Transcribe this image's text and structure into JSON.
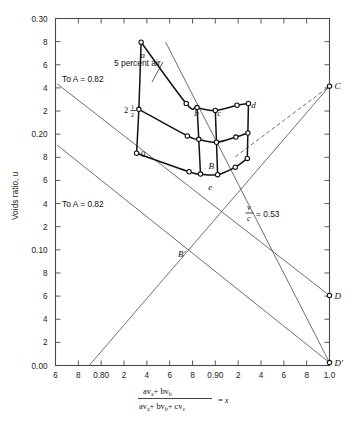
{
  "figure": {
    "title": "",
    "y_axis_title": "Voids ratio, u",
    "x_axis_formula": {
      "numerator": "av",
      "numerator_sub_a": "a",
      "numerator_plus": "+ bv",
      "numerator_sub_b": "b",
      "denominator": "av",
      "denominator_sub_a": "a",
      "denominator_mid": "+ bv",
      "denominator_sub_b": "b",
      "denominator_end": "+ cv",
      "denominator_sub_c": "c",
      "equals": "= x",
      "plain": "(av_a + bv_b) / (av_a + bv_b + cv_c) = x"
    }
  },
  "chart_data": {
    "type": "line",
    "xlabel": "(av_a + bv_b) / (av_a + bv_b + cv_c) = x",
    "ylabel": "Voids ratio, u",
    "xlim": [
      0.76,
      1.0
    ],
    "ylim": [
      0.0,
      0.3
    ],
    "grid": false,
    "legend_position": "none",
    "x_ticks": [
      {
        "value": 0.76,
        "label": "6"
      },
      {
        "value": 0.78,
        "label": "8"
      },
      {
        "value": 0.8,
        "label": "0.80"
      },
      {
        "value": 0.82,
        "label": "2"
      },
      {
        "value": 0.84,
        "label": "4"
      },
      {
        "value": 0.86,
        "label": "6"
      },
      {
        "value": 0.88,
        "label": "8"
      },
      {
        "value": 0.9,
        "label": "0.90"
      },
      {
        "value": 0.92,
        "label": "2"
      },
      {
        "value": 0.94,
        "label": "4"
      },
      {
        "value": 0.96,
        "label": "6"
      },
      {
        "value": 0.98,
        "label": "8"
      },
      {
        "value": 1.0,
        "label": "1.0"
      }
    ],
    "y_ticks": [
      {
        "value": 0.3,
        "label": "0.30"
      },
      {
        "value": 0.28,
        "label": "8"
      },
      {
        "value": 0.26,
        "label": "6"
      },
      {
        "value": 0.24,
        "label": "4"
      },
      {
        "value": 0.22,
        "label": "2"
      },
      {
        "value": 0.2,
        "label": "0.20"
      },
      {
        "value": 0.18,
        "label": "8"
      },
      {
        "value": 0.16,
        "label": "6"
      },
      {
        "value": 0.14,
        "label": "4"
      },
      {
        "value": 0.12,
        "label": "2"
      },
      {
        "value": 0.1,
        "label": "0.10"
      },
      {
        "value": 0.08,
        "label": "8"
      },
      {
        "value": 0.06,
        "label": "6"
      },
      {
        "value": 0.04,
        "label": "4"
      },
      {
        "value": 0.02,
        "label": "2"
      },
      {
        "value": 0.0,
        "label": "0.00"
      }
    ],
    "annotations": [
      {
        "name": "five-percent-air",
        "text": "5 percent air",
        "x": 0.845,
        "y": 0.272
      },
      {
        "name": "contour-2half",
        "text": "2",
        "fraction": "1/2",
        "x": 0.828,
        "y": 0.222
      },
      {
        "name": "contour-0",
        "text": "0",
        "x": 0.835,
        "y": 0.182
      },
      {
        "name": "to-a-upper",
        "text": "To A = 0.82",
        "x": 0.782,
        "y": 0.241
      },
      {
        "name": "to-a-lower",
        "text": "To A = 0.82",
        "x": 0.782,
        "y": 0.143
      },
      {
        "name": "v-over-c",
        "text": "v/c = 0.53",
        "x": 0.935,
        "y": 0.124
      }
    ],
    "point_labels": [
      {
        "name": "a",
        "text": "a",
        "x": 0.8365,
        "y": 0.2685
      },
      {
        "name": "b",
        "text": "b",
        "x": 0.8835,
        "y": 0.2185
      },
      {
        "name": "c",
        "text": "c",
        "x": 0.9035,
        "y": 0.2185
      },
      {
        "name": "d",
        "text": "d",
        "x": 0.9335,
        "y": 0.2255
      },
      {
        "name": "B",
        "text": "B",
        "x": 0.8965,
        "y": 0.1725
      },
      {
        "name": "e",
        "text": "e",
        "x": 0.8955,
        "y": 0.1545
      },
      {
        "name": "B-prime",
        "text": "B'",
        "x": 0.8705,
        "y": 0.0965
      },
      {
        "name": "C",
        "text": "C",
        "x": 1.004,
        "y": 0.2415
      },
      {
        "name": "D",
        "text": "D",
        "x": 1.004,
        "y": 0.0605
      },
      {
        "name": "D-prime",
        "text": "D'",
        "x": 1.004,
        "y": 0.0025
      }
    ],
    "rays": [
      {
        "name": "ray-A-upper",
        "from": [
          0.7615,
          0.2435
        ],
        "to": [
          1.0,
          0.0605
        ],
        "style": "solid",
        "note": "To A=0.82 upper line to D"
      },
      {
        "name": "ray-A-lower",
        "from": [
          0.7615,
          0.1905
        ],
        "to": [
          1.0,
          0.0025
        ],
        "style": "solid",
        "note": "To A=0.82 lower line to D'"
      },
      {
        "name": "ray-to-C",
        "from": [
          0.7895,
          0.0
        ],
        "to": [
          1.0,
          0.2415
        ],
        "style": "solid",
        "note": "rising line to C"
      },
      {
        "name": "ray-e-to-Dprime",
        "from": [
          0.8565,
          0.2795
        ],
        "to": [
          1.0,
          0.0025
        ],
        "style": "solid",
        "note": "5 percent air line through e to D'"
      },
      {
        "name": "ray-C-dashed",
        "from": [
          0.9175,
          0.1805
        ],
        "to": [
          1.0,
          0.2415
        ],
        "style": "dashed",
        "note": "dashed segment to C"
      }
    ],
    "mesh": {
      "note": "Curvilinear quadrilateral mesh of test points (open circles) bounded by heavy curves",
      "rows": [
        {
          "name": "row-5-percent-air",
          "label": "5 percent air",
          "points": [
            [
              0.835,
              0.2795
            ],
            [
              0.8745,
              0.2265
            ],
            [
              0.884,
              0.223
            ],
            [
              0.9,
              0.2205
            ],
            [
              0.919,
              0.225
            ],
            [
              0.929,
              0.2265
            ]
          ]
        },
        {
          "name": "row-2-and-half",
          "label": "2 1/2",
          "points": [
            [
              0.833,
              0.2215
            ],
            [
              0.8755,
              0.1985
            ],
            [
              0.8855,
              0.1955
            ],
            [
              0.901,
              0.193
            ],
            [
              0.918,
              0.1975
            ],
            [
              0.9285,
              0.201
            ]
          ]
        },
        {
          "name": "row-0",
          "label": "0",
          "points": [
            [
              0.831,
              0.1835
            ],
            [
              0.877,
              0.1675
            ],
            [
              0.887,
              0.1655
            ],
            [
              0.902,
              0.165
            ],
            [
              0.9175,
              0.1715
            ],
            [
              0.928,
              0.179
            ]
          ]
        }
      ],
      "columns": [
        {
          "name": "col-left-a",
          "points": [
            [
              0.835,
              0.2795
            ],
            [
              0.833,
              0.2215
            ],
            [
              0.831,
              0.1835
            ]
          ]
        },
        {
          "name": "col-b",
          "points": [
            [
              0.884,
              0.223
            ],
            [
              0.8855,
              0.1955
            ],
            [
              0.887,
              0.1655
            ]
          ]
        },
        {
          "name": "col-c",
          "points": [
            [
              0.9,
              0.2205
            ],
            [
              0.901,
              0.193
            ],
            [
              0.902,
              0.165
            ]
          ]
        },
        {
          "name": "col-d",
          "points": [
            [
              0.929,
              0.2265
            ],
            [
              0.9285,
              0.201
            ],
            [
              0.928,
              0.179
            ]
          ]
        }
      ],
      "extra_nodes": [
        [
          0.8745,
          0.2265
        ],
        [
          0.8755,
          0.1985
        ],
        [
          0.877,
          0.1675
        ],
        [
          0.919,
          0.225
        ],
        [
          0.918,
          0.1975
        ],
        [
          0.9175,
          0.1715
        ]
      ]
    }
  }
}
